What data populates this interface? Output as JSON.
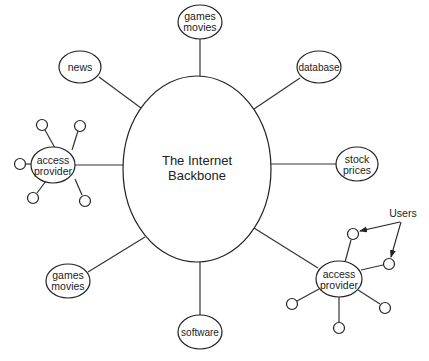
{
  "diagram": {
    "title": "The Internet Backbone",
    "center": {
      "line1": "The Internet",
      "line2": "Backbone"
    },
    "nodes": {
      "top_games": {
        "line1": "games",
        "line2": "movies"
      },
      "news": {
        "label": "news"
      },
      "database": {
        "label": "database"
      },
      "stock": {
        "line1": "stock",
        "line2": "prices"
      },
      "left_provider": {
        "line1": "access",
        "line2": "provider"
      },
      "bottom_games": {
        "line1": "games",
        "line2": "movies"
      },
      "software": {
        "label": "software"
      },
      "right_provider": {
        "line1": "access",
        "line2": "provider"
      }
    },
    "annotation": {
      "users_label": "Users"
    },
    "colors": {
      "stroke": "#222222",
      "background": "#ffffff",
      "text": "#222222"
    }
  }
}
